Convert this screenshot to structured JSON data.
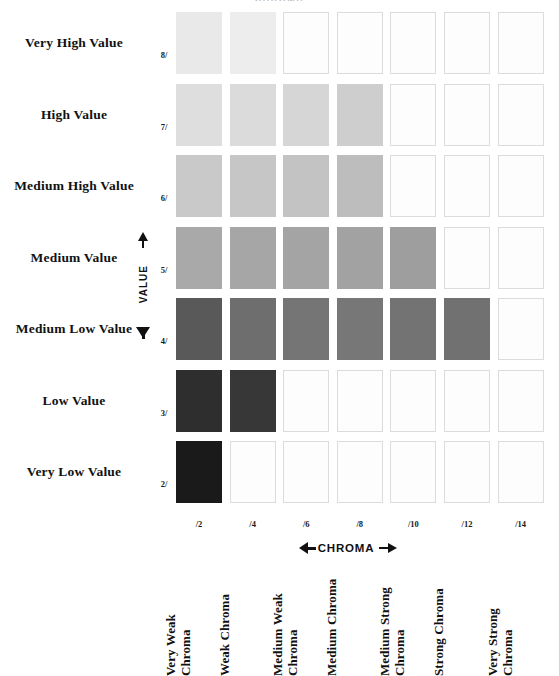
{
  "clipped_title": "CHROMA",
  "value_axis": {
    "label": "VALUE",
    "names": [
      "Very High Value",
      "High Value",
      "Medium High Value",
      "Medium Value",
      "Medium Low Value",
      "Low Value",
      "Very Low Value"
    ],
    "ticks": [
      "8/",
      "7/",
      "6/",
      "5/",
      "4/",
      "3/",
      "2/"
    ]
  },
  "chroma_axis": {
    "label": "CHROMA",
    "ticks": [
      "/2",
      "/4",
      "/6",
      "/8",
      "/10",
      "/12",
      "/14"
    ],
    "names": [
      "Very Weak\nChroma",
      "Weak Chroma",
      "Medium Weak\nChroma",
      "Medium Chroma",
      "Medium Strong\nChroma",
      "Strong Chroma",
      "Very Strong\nChroma"
    ]
  },
  "chart_data": {
    "type": "heatmap",
    "xlabel": "CHROMA",
    "ylabel": "VALUE",
    "x": [
      "/2",
      "/4",
      "/6",
      "/8",
      "/10",
      "/12",
      "/14"
    ],
    "y": [
      "8/",
      "7/",
      "6/",
      "5/",
      "4/",
      "3/",
      "2/"
    ],
    "grid": true,
    "legend": "none",
    "empty_color": "#fdfdfd",
    "empty_border": "#dcdcdc",
    "note": "Filled swatches form a stepped diamond: count of filled cells per value row (top to bottom) is 2, 4, 4, 5, 6, 2, 1.",
    "rows": [
      {
        "value": "8/",
        "value_name": "Very High Value",
        "filled_count": 2,
        "cells": [
          {
            "chroma": "/2",
            "filled": true,
            "color": "#e9e9e9"
          },
          {
            "chroma": "/4",
            "filled": true,
            "color": "#ededed"
          },
          {
            "chroma": "/6",
            "filled": false,
            "color": "#fdfdfd"
          },
          {
            "chroma": "/8",
            "filled": false,
            "color": "#fdfdfd"
          },
          {
            "chroma": "/10",
            "filled": false,
            "color": "#fdfdfd"
          },
          {
            "chroma": "/12",
            "filled": false,
            "color": "#fdfdfd"
          },
          {
            "chroma": "/14",
            "filled": false,
            "color": "#fdfdfd"
          }
        ]
      },
      {
        "value": "7/",
        "value_name": "High Value",
        "filled_count": 4,
        "cells": [
          {
            "chroma": "/2",
            "filled": true,
            "color": "#dedede"
          },
          {
            "chroma": "/4",
            "filled": true,
            "color": "#dbdbdb"
          },
          {
            "chroma": "/6",
            "filled": true,
            "color": "#d6d6d6"
          },
          {
            "chroma": "/8",
            "filled": true,
            "color": "#cecece"
          },
          {
            "chroma": "/10",
            "filled": false,
            "color": "#fdfdfd"
          },
          {
            "chroma": "/12",
            "filled": false,
            "color": "#fdfdfd"
          },
          {
            "chroma": "/14",
            "filled": false,
            "color": "#fdfdfd"
          }
        ]
      },
      {
        "value": "6/",
        "value_name": "Medium High Value",
        "filled_count": 4,
        "cells": [
          {
            "chroma": "/2",
            "filled": true,
            "color": "#c9c9c9"
          },
          {
            "chroma": "/4",
            "filled": true,
            "color": "#c6c6c6"
          },
          {
            "chroma": "/6",
            "filled": true,
            "color": "#c3c3c3"
          },
          {
            "chroma": "/8",
            "filled": true,
            "color": "#bdbdbd"
          },
          {
            "chroma": "/10",
            "filled": false,
            "color": "#fdfdfd"
          },
          {
            "chroma": "/12",
            "filled": false,
            "color": "#fdfdfd"
          },
          {
            "chroma": "/14",
            "filled": false,
            "color": "#fdfdfd"
          }
        ]
      },
      {
        "value": "5/",
        "value_name": "Medium Value",
        "filled_count": 5,
        "cells": [
          {
            "chroma": "/2",
            "filled": true,
            "color": "#a9a9a9"
          },
          {
            "chroma": "/4",
            "filled": true,
            "color": "#a6a6a6"
          },
          {
            "chroma": "/6",
            "filled": true,
            "color": "#a4a4a4"
          },
          {
            "chroma": "/8",
            "filled": true,
            "color": "#a2a2a2"
          },
          {
            "chroma": "/10",
            "filled": true,
            "color": "#9e9e9e"
          },
          {
            "chroma": "/12",
            "filled": false,
            "color": "#fdfdfd"
          },
          {
            "chroma": "/14",
            "filled": false,
            "color": "#fdfdfd"
          }
        ]
      },
      {
        "value": "4/",
        "value_name": "Medium Low Value",
        "filled_count": 6,
        "cells": [
          {
            "chroma": "/2",
            "filled": true,
            "color": "#595959"
          },
          {
            "chroma": "/4",
            "filled": true,
            "color": "#6e6e6e"
          },
          {
            "chroma": "/6",
            "filled": true,
            "color": "#757575"
          },
          {
            "chroma": "/8",
            "filled": true,
            "color": "#777777"
          },
          {
            "chroma": "/10",
            "filled": true,
            "color": "#737373"
          },
          {
            "chroma": "/12",
            "filled": true,
            "color": "#717171"
          },
          {
            "chroma": "/14",
            "filled": false,
            "color": "#fdfdfd"
          }
        ]
      },
      {
        "value": "3/",
        "value_name": "Low Value",
        "filled_count": 2,
        "cells": [
          {
            "chroma": "/2",
            "filled": true,
            "color": "#2e2e2e"
          },
          {
            "chroma": "/4",
            "filled": true,
            "color": "#373737"
          },
          {
            "chroma": "/6",
            "filled": false,
            "color": "#fdfdfd"
          },
          {
            "chroma": "/8",
            "filled": false,
            "color": "#fdfdfd"
          },
          {
            "chroma": "/10",
            "filled": false,
            "color": "#fdfdfd"
          },
          {
            "chroma": "/12",
            "filled": false,
            "color": "#fdfdfd"
          },
          {
            "chroma": "/14",
            "filled": false,
            "color": "#fdfdfd"
          }
        ]
      },
      {
        "value": "2/",
        "value_name": "Very Low Value",
        "filled_count": 1,
        "cells": [
          {
            "chroma": "/2",
            "filled": true,
            "color": "#1a1a1a"
          },
          {
            "chroma": "/4",
            "filled": false,
            "color": "#fdfdfd"
          },
          {
            "chroma": "/6",
            "filled": false,
            "color": "#fdfdfd"
          },
          {
            "chroma": "/8",
            "filled": false,
            "color": "#fdfdfd"
          },
          {
            "chroma": "/10",
            "filled": false,
            "color": "#fdfdfd"
          },
          {
            "chroma": "/12",
            "filled": false,
            "color": "#fdfdfd"
          },
          {
            "chroma": "/14",
            "filled": false,
            "color": "#fdfdfd"
          }
        ]
      }
    ]
  }
}
